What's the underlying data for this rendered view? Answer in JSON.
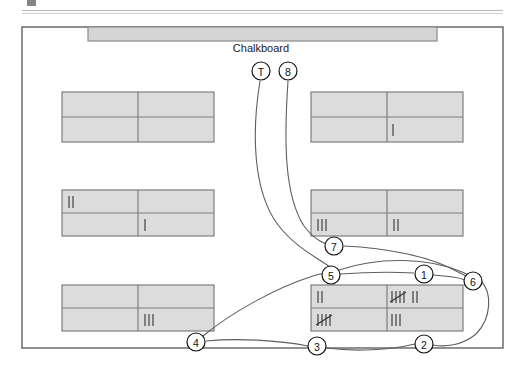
{
  "figure": {
    "type": "classroom-seating-movement-diagram",
    "caption_rule_visible": true,
    "room": {
      "label": "",
      "border_color": "#555555",
      "fill_color": "#ffffff",
      "x": 22,
      "y": 27,
      "width": 481,
      "height": 321
    },
    "chalkboard": {
      "label": "Chalkboard",
      "fill_color": "#d5d5d5",
      "border_color": "#8a8a8a",
      "x": 88,
      "y": 27,
      "width": 349,
      "height": 14
    }
  },
  "desk_groups": [
    {
      "id": "desk-group-top-left",
      "x": 62,
      "y": 92,
      "width": 152,
      "height": 50,
      "cells": [
        {
          "position": "top-left",
          "tally": ""
        },
        {
          "position": "top-right",
          "tally": ""
        },
        {
          "position": "bottom-left",
          "tally": ""
        },
        {
          "position": "bottom-right",
          "tally": ""
        }
      ]
    },
    {
      "id": "desk-group-top-right",
      "x": 311,
      "y": 92,
      "width": 152,
      "height": 50,
      "cells": [
        {
          "position": "top-left",
          "tally": ""
        },
        {
          "position": "top-right",
          "tally": ""
        },
        {
          "position": "bottom-left",
          "tally": ""
        },
        {
          "position": "bottom-right",
          "tally": "|"
        }
      ]
    },
    {
      "id": "desk-group-middle-left",
      "x": 62,
      "y": 190,
      "width": 152,
      "height": 46,
      "cells": [
        {
          "position": "top-left",
          "tally": "||"
        },
        {
          "position": "top-right",
          "tally": ""
        },
        {
          "position": "bottom-left",
          "tally": ""
        },
        {
          "position": "bottom-right",
          "tally": "|"
        }
      ]
    },
    {
      "id": "desk-group-middle-right",
      "x": 311,
      "y": 190,
      "width": 152,
      "height": 46,
      "cells": [
        {
          "position": "top-left",
          "tally": ""
        },
        {
          "position": "top-right",
          "tally": ""
        },
        {
          "position": "bottom-left",
          "tally": "|||"
        },
        {
          "position": "bottom-right",
          "tally": "||"
        }
      ]
    },
    {
      "id": "desk-group-bottom-left",
      "x": 62,
      "y": 285,
      "width": 152,
      "height": 46,
      "cells": [
        {
          "position": "top-left",
          "tally": ""
        },
        {
          "position": "top-right",
          "tally": ""
        },
        {
          "position": "bottom-left",
          "tally": ""
        },
        {
          "position": "bottom-right",
          "tally": "|||"
        }
      ]
    },
    {
      "id": "desk-group-bottom-right",
      "x": 311,
      "y": 285,
      "width": 152,
      "height": 46,
      "cells": [
        {
          "position": "top-left",
          "tally": "||"
        },
        {
          "position": "top-right",
          "tally": "5+2"
        },
        {
          "position": "bottom-left",
          "tally": "5"
        },
        {
          "position": "bottom-right",
          "tally": "|||"
        }
      ]
    }
  ],
  "markers": [
    {
      "id": "marker-T",
      "label": "T",
      "cx": 261,
      "cy": 71,
      "r": 9
    },
    {
      "id": "marker-8",
      "label": "8",
      "cx": 288,
      "cy": 71,
      "r": 9
    },
    {
      "id": "marker-7",
      "label": "7",
      "cx": 334,
      "cy": 246,
      "r": 9
    },
    {
      "id": "marker-5",
      "label": "5",
      "cx": 331,
      "cy": 275,
      "r": 9
    },
    {
      "id": "marker-1",
      "label": "1",
      "cx": 424,
      "cy": 274,
      "r": 9
    },
    {
      "id": "marker-6",
      "label": "6",
      "cx": 473,
      "cy": 281,
      "r": 9
    },
    {
      "id": "marker-4",
      "label": "4",
      "cx": 196,
      "cy": 342,
      "r": 9
    },
    {
      "id": "marker-3",
      "label": "3",
      "cx": 317,
      "cy": 346,
      "r": 9
    },
    {
      "id": "marker-2",
      "label": "2",
      "cx": 424,
      "cy": 344,
      "r": 9
    }
  ]
}
